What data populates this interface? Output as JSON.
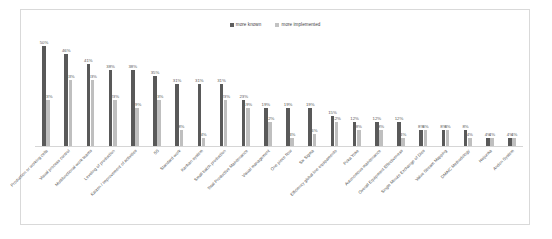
{
  "chart_data": {
    "type": "bar",
    "title": "",
    "xlabel": "",
    "ylabel": "",
    "ylim": [
      0,
      55
    ],
    "grid": false,
    "legend_position": "top-center",
    "legend": [
      "more known",
      "more implemented"
    ],
    "categories": [
      "Production or working cells",
      "Visual process control",
      "Multifunctional work teams",
      "Leveling of production",
      "Kaizen / Improvement of activities",
      "5S",
      "Standard work",
      "Kanban system",
      "Small batch production",
      "Total Productive Maintenance",
      "Visual management",
      "One piece flow",
      "Six Sigma",
      "Efficiency global line equipamento",
      "Poka Yoke",
      "Autonomous maintenance",
      "Overall Equipment Effectiveness",
      "Single Minute Exchange of Dies",
      "Value Stream Mapping",
      "DMAIC Methodology",
      "Heijunka",
      "Andon System"
    ],
    "series": [
      {
        "name": "more known",
        "color": "#595959",
        "values": [
          50,
          46,
          41,
          38,
          38,
          35,
          31,
          31,
          31,
          23,
          19,
          19,
          19,
          15,
          12,
          12,
          12,
          8,
          8,
          8,
          4,
          4
        ],
        "labels": [
          "50%",
          "46%",
          "41%",
          "38%",
          "38%",
          "35%",
          "31%",
          "31%",
          "31%",
          "23%",
          "19%",
          "19%",
          "19%",
          "15%",
          "12%",
          "12%",
          "12%",
          "8%",
          "8%",
          "8%",
          "4%",
          "4%"
        ]
      },
      {
        "name": "more implemented",
        "color": "#bfbfbf",
        "values": [
          23,
          33,
          33,
          23,
          19,
          23,
          8,
          4,
          23,
          19,
          12,
          4,
          6,
          12,
          8,
          8,
          4,
          8,
          8,
          4,
          4,
          4
        ],
        "labels": [
          "23%",
          "33%",
          "33%",
          "23%",
          "19%",
          "23%",
          "8%",
          "4%",
          "23%",
          "19%",
          "12%",
          "4%",
          "6%",
          "12%",
          "8%",
          "8%",
          "4%",
          "8%",
          "8%",
          "4%",
          "4%",
          "4%"
        ]
      }
    ]
  }
}
